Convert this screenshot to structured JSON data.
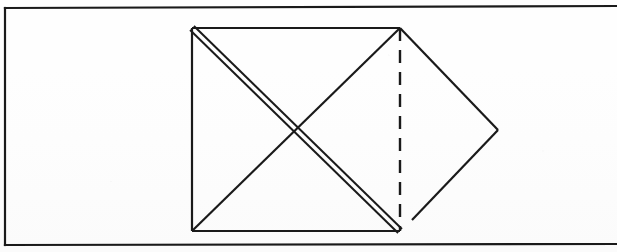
{
  "figure": {
    "caption": "",
    "background_color": "#fefefe",
    "ink_color": "#1a1a1a",
    "frame": {
      "name": "page-border",
      "style": "solid",
      "sides_drawn": [
        "top",
        "left",
        "bottom"
      ],
      "right_side_open": true,
      "x1": 5,
      "y1": 8,
      "x2": 617,
      "y2": 245,
      "stroke_width": 2.2,
      "top_left_corner": [
        5,
        8
      ],
      "bottom_left_corner": [
        5,
        245
      ]
    },
    "square": {
      "name": "main-square",
      "top_left": [
        192,
        28
      ],
      "top_right": [
        400,
        28
      ],
      "bottom_right": [
        400,
        231
      ],
      "bottom_left": [
        192,
        231
      ],
      "width": 208,
      "height": 203,
      "stroke_width": 2.2,
      "edges": [
        {
          "name": "square-top-edge",
          "from": [
            192,
            28
          ],
          "to": [
            400,
            28
          ],
          "style": "solid"
        },
        {
          "name": "square-left-edge",
          "from": [
            192,
            28
          ],
          "to": [
            192,
            231
          ],
          "style": "solid"
        },
        {
          "name": "square-bottom-edge",
          "from": [
            192,
            231
          ],
          "to": [
            400,
            231
          ],
          "style": "solid"
        },
        {
          "name": "square-right-edge",
          "from": [
            400,
            28
          ],
          "to": [
            400,
            231
          ],
          "style": "dashed"
        }
      ]
    },
    "diagonals": {
      "primary": {
        "name": "diagonal-top-left-to-bottom-right",
        "from": [
          192,
          28
        ],
        "to": [
          400,
          231
        ],
        "style": "doubled",
        "offset": 5.5,
        "stroke_width": 2.0,
        "note": "drawn as two closely spaced parallel lines"
      },
      "secondary": {
        "name": "diagonal-top-right-to-bottom-left",
        "from": [
          400,
          28
        ],
        "to": [
          192,
          231
        ],
        "style": "solid",
        "stroke_width": 2.2
      },
      "crossing_point": [
        296,
        130
      ]
    },
    "dashed_line": {
      "name": "dashed-vertical-fold-line",
      "from": [
        400,
        28
      ],
      "to": [
        400,
        231
      ],
      "style": "dashed",
      "dash_length": 13,
      "gap_length": 9,
      "stroke_width": 2.4
    },
    "right_triangle": {
      "name": "right-point-triangle",
      "apex": [
        498,
        130
      ],
      "upper_edge": {
        "name": "triangle-upper-edge",
        "from": [
          400,
          28
        ],
        "to": [
          498,
          130
        ],
        "style": "solid"
      },
      "lower_edge": {
        "name": "triangle-lower-edge",
        "from": [
          498,
          130
        ],
        "to": [
          412,
          220
        ],
        "style": "solid",
        "note": "stops short of bottom-right corner leaving a visible gap"
      }
    },
    "vertices": [
      {
        "name": "vertex-top-left",
        "x": 192,
        "y": 28
      },
      {
        "name": "vertex-top-right",
        "x": 400,
        "y": 28
      },
      {
        "name": "vertex-bottom-left",
        "x": 192,
        "y": 231
      },
      {
        "name": "vertex-bottom-right",
        "x": 400,
        "y": 231
      },
      {
        "name": "vertex-right-apex",
        "x": 498,
        "y": 130
      },
      {
        "name": "vertex-center-crossing",
        "x": 296,
        "y": 130
      }
    ]
  }
}
